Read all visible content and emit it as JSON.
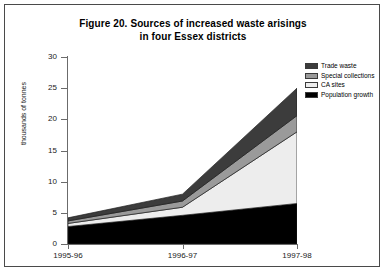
{
  "figure": {
    "title_line1": "Figure 20. Sources of increased waste arisings",
    "title_line2": "in four Essex districts"
  },
  "chart_data": {
    "type": "area",
    "title": "Figure 20. Sources of increased waste arisings in four Essex districts",
    "xlabel": "",
    "ylabel": "thousands of tonnes",
    "categories": [
      "1995-96",
      "1996-97",
      "1997-98"
    ],
    "ylim": [
      0,
      30
    ],
    "ytick_labels": [
      "0",
      "5",
      "10",
      "15",
      "20",
      "25",
      "30"
    ],
    "ytick_values": [
      0,
      5,
      10,
      15,
      20,
      25,
      30
    ],
    "grid": false,
    "stacked": true,
    "legend_position": "top-right",
    "series": [
      {
        "name": "Population growth",
        "color": "#000000",
        "values": [
          2.8,
          4.6,
          6.5
        ]
      },
      {
        "name": "CA sites",
        "color": "#ededed",
        "values": [
          0.5,
          1.3,
          11.5
        ]
      },
      {
        "name": "Special collections",
        "color": "#9a9a9a",
        "values": [
          0.4,
          1.0,
          2.6
        ]
      },
      {
        "name": "Trade waste",
        "color": "#3c3c3c",
        "values": [
          0.5,
          1.1,
          4.4
        ]
      }
    ],
    "totals": [
      4.2,
      8.0,
      25.0
    ]
  },
  "legend": {
    "items": [
      {
        "label": "Trade waste",
        "color": "#3c3c3c"
      },
      {
        "label": "Special collections",
        "color": "#9a9a9a"
      },
      {
        "label": "CA sites",
        "color": "#ededed"
      },
      {
        "label": "Population growth",
        "color": "#000000"
      }
    ]
  },
  "axes": {
    "y_title": "thousands of tonnes",
    "y_ticks": [
      "30",
      "25",
      "20",
      "15",
      "10",
      "5",
      "0"
    ],
    "x_ticks": [
      "1995-96",
      "1996-97",
      "1997-98"
    ]
  }
}
